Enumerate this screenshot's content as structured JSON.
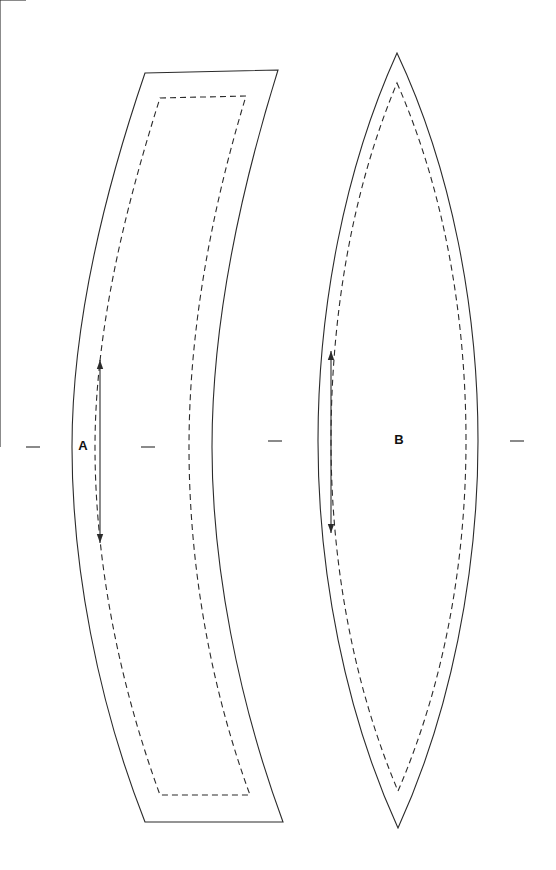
{
  "document": {
    "kind": "sewing-pattern-sheet",
    "background_color": "#ffffff",
    "line_color": "#2b2b2b",
    "width_px": 556,
    "height_px": 870
  },
  "pieces": [
    {
      "id": "A",
      "label": "A",
      "label_x": 83,
      "label_y": 447,
      "shape": "crescent-curved-panel",
      "cut_line_path": "M145,73 L278,70 C236,205 212,330 212,447 C212,565 238,700 283,822 L145,822 C97,700 72,565 72,447 C72,330 100,205 145,73 Z",
      "seam_line_path": "M160,98 L246,96 C209,218 189,336 189,447 C189,559 208,680 250,795 L160,795 C118,680 95,559 95,447 C95,336 122,218 160,98 Z",
      "notches": [
        {
          "name": "notch-left",
          "x1": 26,
          "y1": 447,
          "x2": 40,
          "y2": 447
        },
        {
          "name": "notch-right",
          "x1": 141,
          "y1": 447,
          "x2": 155,
          "y2": 447
        }
      ],
      "grainline": {
        "name": "grainline-arrow-a",
        "x": 100,
        "y_top": 360,
        "y_bottom": 543,
        "double_headed": true
      }
    },
    {
      "id": "B",
      "label": "B",
      "label_x": 399,
      "label_y": 441,
      "shape": "lens-pointed-oval",
      "cut_line_path": "M397,53 C452,170 478,310 478,441 C478,572 451,712 398,828 C345,712 318,572 318,441 C318,310 344,170 397,53 Z",
      "seam_line_path": "M397,83 C444,190 466,315 466,441 C466,560 445,682 398,791 C352,682 331,560 331,441 C331,315 352,190 397,83 Z",
      "notches": [
        {
          "name": "notch-left",
          "x1": 268,
          "y1": 441,
          "x2": 282,
          "y2": 441
        },
        {
          "name": "notch-right",
          "x1": 510,
          "y1": 441,
          "x2": 524,
          "y2": 441
        }
      ],
      "grainline": {
        "name": "grainline-arrow-b",
        "x": 331,
        "y_top": 351,
        "y_bottom": 533,
        "double_headed": true
      }
    }
  ]
}
